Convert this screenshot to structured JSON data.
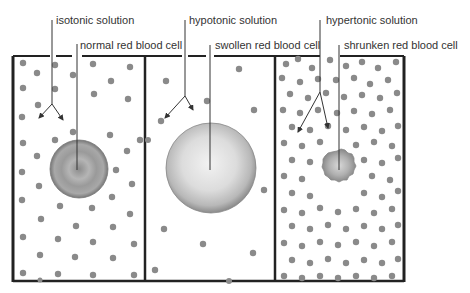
{
  "diagram": {
    "panels": [
      {
        "id": "isotonic",
        "solution_label": "isotonic solution",
        "cell_label": "normal red blood cell",
        "cell_state": "normal"
      },
      {
        "id": "hypotonic",
        "solution_label": "hypotonic solution",
        "cell_label": "swollen red blood cell",
        "cell_state": "swollen"
      },
      {
        "id": "hypertonic",
        "solution_label": "hypertonic solution",
        "cell_label": "shrunken red blood cell",
        "cell_state": "shrunken"
      }
    ],
    "colors": {
      "border": "#222222",
      "particle": "#8a8a8a",
      "label_text": "#333333"
    }
  }
}
